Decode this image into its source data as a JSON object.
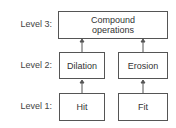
{
  "diagram": {
    "levels": [
      {
        "label": "Level 3:"
      },
      {
        "label": "Level 2:"
      },
      {
        "label": "Level 1:"
      }
    ],
    "nodes": {
      "compound": "Compound operations",
      "dilation": "Dilation",
      "erosion": "Erosion",
      "hit": "Hit",
      "fit": "Fit"
    },
    "edges": [
      {
        "from": "hit",
        "to": "dilation"
      },
      {
        "from": "fit",
        "to": "erosion"
      },
      {
        "from": "dilation",
        "to": "compound"
      },
      {
        "from": "erosion",
        "to": "compound"
      }
    ],
    "colors": {
      "line": "#555555",
      "text": "#333333"
    }
  }
}
